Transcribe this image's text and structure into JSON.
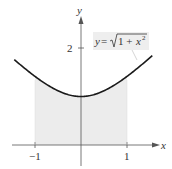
{
  "chart_data": {
    "type": "area",
    "title": "",
    "function_label": "y = √(1 + x²)",
    "xlabel": "x",
    "ylabel": "y",
    "xlim": [
      -1.45,
      1.55
    ],
    "ylim": [
      -0.5,
      2.9
    ],
    "x_ticks": [
      {
        "value": -1,
        "label": "−1"
      },
      {
        "value": 1,
        "label": "1"
      }
    ],
    "y_ticks": [
      {
        "value": 2,
        "label": "2"
      }
    ],
    "shaded_region": {
      "x_from": -1,
      "x_to": 1,
      "under": "y = sqrt(1 + x^2)"
    },
    "series": [
      {
        "name": "y = sqrt(1 + x^2)",
        "x": [
          -1.45,
          -1.25,
          -1,
          -0.75,
          -0.5,
          -0.25,
          0,
          0.25,
          0.5,
          0.75,
          1,
          1.25,
          1.55
        ],
        "y": [
          1.76,
          1.6,
          1.414,
          1.25,
          1.118,
          1.031,
          1,
          1.031,
          1.118,
          1.25,
          1.414,
          1.6,
          1.845
        ]
      }
    ],
    "grid": false,
    "colors": {
      "curve": "#1a1a1a",
      "shade": "#ececec",
      "axes": "#555555",
      "label_box": "#eeeeee"
    }
  },
  "labels": {
    "x_axis": "x",
    "y_axis": "y",
    "tick_neg1": "−1",
    "tick_1": "1",
    "tick_2": "2",
    "eq_y": "y",
    "eq_eq": " = ",
    "eq_one_plus": "1 + ",
    "eq_x": "x",
    "eq_sq": "2"
  }
}
